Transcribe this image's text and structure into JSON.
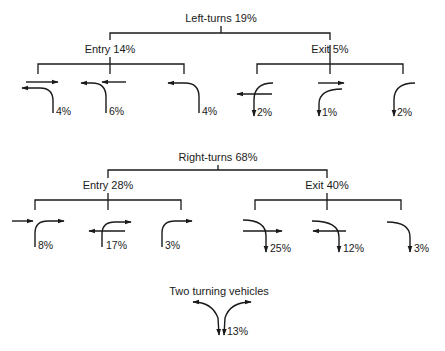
{
  "left_turns": {
    "title": "Left-turns 19%",
    "entry": {
      "label": "Entry 14%",
      "cases": [
        {
          "pct": "4%"
        },
        {
          "pct": "6%"
        },
        {
          "pct": "4%"
        }
      ]
    },
    "exit": {
      "label": "Exit 5%",
      "cases": [
        {
          "pct": "2%"
        },
        {
          "pct": "1%"
        },
        {
          "pct": "2%"
        }
      ]
    }
  },
  "right_turns": {
    "title": "Right-turns 68%",
    "entry": {
      "label": "Entry 28%",
      "cases": [
        {
          "pct": "8%"
        },
        {
          "pct": "17%"
        },
        {
          "pct": "3%"
        }
      ]
    },
    "exit": {
      "label": "Exit 40%",
      "cases": [
        {
          "pct": "25%"
        },
        {
          "pct": "12%"
        },
        {
          "pct": "3%"
        }
      ]
    }
  },
  "two_turning": {
    "title": "Two turning vehicles",
    "pct": "13%"
  },
  "colors": {
    "ink": "#1a1a1a",
    "background": "#ffffff"
  }
}
